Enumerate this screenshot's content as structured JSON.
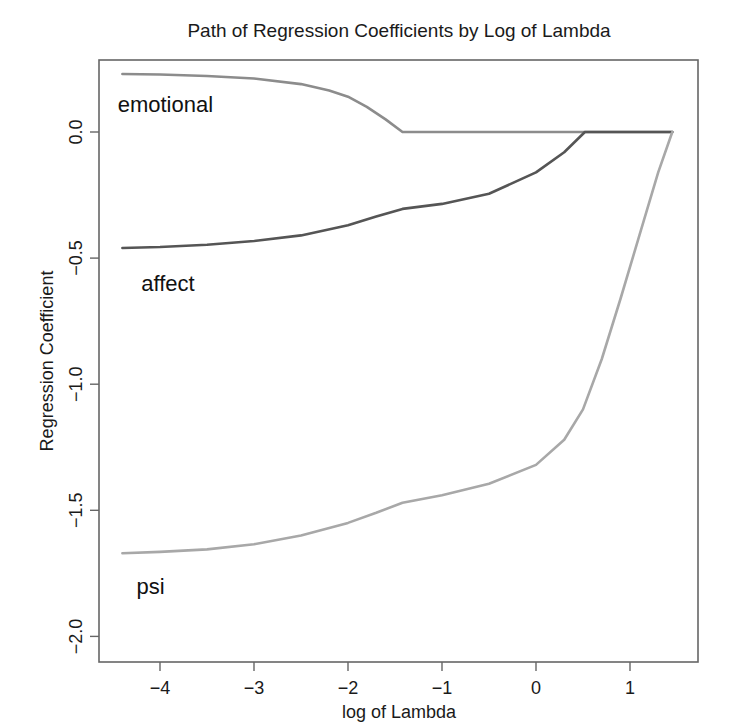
{
  "chart_data": {
    "type": "line",
    "title": "Path of Regression Coefficients by Log of Lambda",
    "xlabel": "log of Lambda",
    "ylabel": "Regression Coefficient",
    "xlim": [
      -4.7,
      1.7
    ],
    "ylim": [
      -2.1,
      0.28
    ],
    "x_ticks": [
      -4,
      -3,
      -2,
      -1,
      0,
      1
    ],
    "x_tick_labels": [
      "−4",
      "−3",
      "−2",
      "−1",
      "0",
      "1"
    ],
    "y_ticks": [
      0.0,
      -0.5,
      -1.0,
      -1.5,
      -2.0
    ],
    "y_tick_labels": [
      "0.0",
      "−0.5",
      "−1.0",
      "−1.5",
      "−2.0"
    ],
    "grid": false,
    "legend": "none (direct line labels)",
    "series": [
      {
        "name": "emotional",
        "color": "#8c8c8c",
        "label_pos": [
          -4.45,
          0.08
        ],
        "x": [
          -4.4,
          -4.0,
          -3.5,
          -3.0,
          -2.5,
          -2.2,
          -2.0,
          -1.8,
          -1.6,
          -1.42,
          -1.0,
          0.0,
          0.52,
          1.0,
          1.45
        ],
        "y": [
          0.23,
          0.228,
          0.222,
          0.212,
          0.19,
          0.165,
          0.14,
          0.1,
          0.05,
          0.0,
          0.0,
          0.0,
          0.0,
          0.0,
          0.0
        ]
      },
      {
        "name": "affect",
        "color": "#555555",
        "label_pos": [
          -4.2,
          -0.63
        ],
        "x": [
          -4.4,
          -4.0,
          -3.5,
          -3.0,
          -2.5,
          -2.0,
          -1.7,
          -1.42,
          -1.0,
          -0.5,
          0.0,
          0.3,
          0.52,
          1.0,
          1.45
        ],
        "y": [
          -0.46,
          -0.456,
          -0.447,
          -0.432,
          -0.41,
          -0.37,
          -0.335,
          -0.305,
          -0.285,
          -0.245,
          -0.16,
          -0.08,
          0.0,
          0.0,
          0.0
        ]
      },
      {
        "name": "psi",
        "color": "#a8a8a8",
        "label_pos": [
          -4.25,
          -1.83
        ],
        "x": [
          -4.4,
          -4.0,
          -3.5,
          -3.0,
          -2.5,
          -2.0,
          -1.7,
          -1.42,
          -1.0,
          -0.5,
          0.0,
          0.3,
          0.5,
          0.7,
          0.9,
          1.1,
          1.3,
          1.45
        ],
        "y": [
          -1.67,
          -1.665,
          -1.655,
          -1.635,
          -1.6,
          -1.55,
          -1.51,
          -1.47,
          -1.44,
          -1.395,
          -1.32,
          -1.22,
          -1.1,
          -0.9,
          -0.66,
          -0.41,
          -0.16,
          0.0
        ]
      }
    ]
  }
}
